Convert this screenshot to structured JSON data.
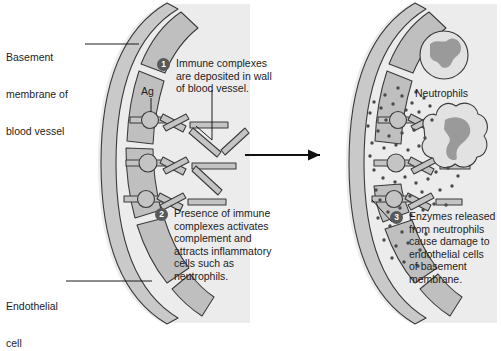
{
  "figure": {
    "background": "#ffffff",
    "panel_fill": "#ececed",
    "vessel_wall_fill": "#c9c9ca",
    "endothelial_fill": "#bfbfc0",
    "complex_fill": "#c4c4c5",
    "outline": "#3a3a3a",
    "badge_fill": "#58595b",
    "badge_text": "#ffffff",
    "enzyme_dot_color": "#4a4a4a",
    "nucleus_fill": "#9a9a9b"
  },
  "labels": {
    "basement_membrane": [
      "Basement",
      "membrane of",
      "blood vessel"
    ],
    "antigen": "Ag",
    "endothelial_cell": [
      "Endothelial",
      "cell"
    ],
    "neutrophils": "Neutrophils"
  },
  "callouts": [
    {
      "number": "1",
      "lines": [
        "Immune complexes",
        "are deposited in wall",
        "of blood vessel."
      ]
    },
    {
      "number": "2",
      "lines": [
        "Presence of immune",
        "complexes activates",
        "complement and",
        "attracts inflammatory",
        "cells such as",
        "neutrophils."
      ]
    },
    {
      "number": "3",
      "lines": [
        "Enzymes released",
        "from neutrophils",
        "cause damage to",
        "endothelial cells",
        "of basement",
        "membrane."
      ]
    }
  ],
  "panels": {
    "left": {
      "name": "Before: immune complex deposition",
      "immune_complex_count": 3,
      "antigen_nodes": 3
    },
    "right": {
      "name": "After: neutrophil infiltration and enzyme release",
      "neutrophil_count": 2,
      "enzyme_dot_count": 60,
      "immune_complex_count": 3
    }
  },
  "arrow": {
    "name": "progression-arrow",
    "direction": "right"
  }
}
